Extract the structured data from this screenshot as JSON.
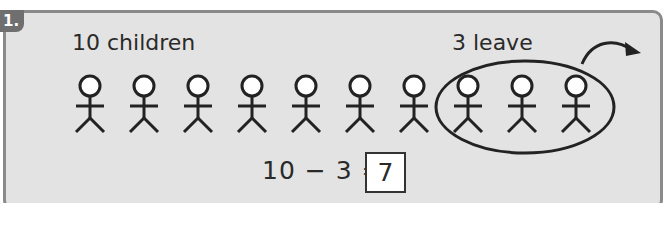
{
  "question": {
    "number": "1.",
    "left_label": "10 children",
    "right_label": "3 leave",
    "total_children": 10,
    "leaving_children": 3,
    "equation": "10 − 3 =",
    "answer": "7"
  },
  "colors": {
    "panel_background": "#e3e3e3",
    "panel_border": "#8a8a8a",
    "badge_background": "#6f6f6f",
    "ink": "#222222"
  }
}
